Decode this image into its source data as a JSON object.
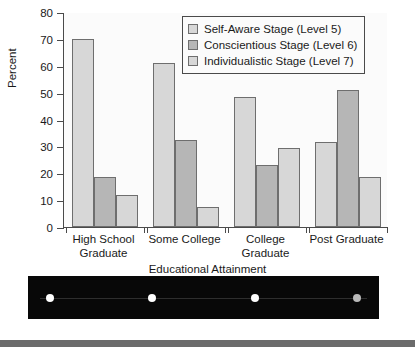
{
  "chart_data": {
    "type": "bar",
    "title": "",
    "subtitle": "",
    "xlabel": "Educational Attainment",
    "ylabel": "Percent",
    "categories": [
      "High School\nGraduate",
      "Some College",
      "College\nGraduate",
      "Post Graduate"
    ],
    "series": [
      {
        "name": "Self-Aware Stage (Level 5)",
        "color": "#d7d7d7",
        "values": [
          70,
          61,
          48.5,
          31.5
        ]
      },
      {
        "name": "Conscientious Stage (Level 6)",
        "color": "#b6b6b6",
        "values": [
          18.5,
          32.5,
          23,
          51
        ]
      },
      {
        "name": "Individualistic Stage (Level 7)",
        "color": "#d7d7d7",
        "values": [
          12,
          7.5,
          29.5,
          18.5
        ]
      }
    ],
    "ylim": [
      0,
      80
    ],
    "ytick_labels": [
      "0",
      "10",
      "20",
      "30",
      "40",
      "50",
      "60",
      "70",
      "80"
    ],
    "ytick_values": [
      0,
      10,
      20,
      30,
      40,
      50,
      60,
      70,
      80
    ],
    "grid": false,
    "legend_position": "top-right"
  },
  "legend": {
    "entries": [
      {
        "label": "Self-Aware Stage (Level 5)",
        "color": "#d7d7d7"
      },
      {
        "label": "Conscientious Stage (Level 6)",
        "color": "#b6b6b6"
      },
      {
        "label": "Individualistic Stage (Level 7)",
        "color": "#d7d7d7"
      }
    ]
  },
  "footer_strip": {
    "background": "#080808",
    "dots": [
      {
        "color": "#ffffff"
      },
      {
        "color": "#ffffff"
      },
      {
        "color": "#fdfdfd"
      },
      {
        "color": "#b9b9b9"
      }
    ]
  },
  "bottom_band": {
    "color": "#6b6b6b"
  }
}
